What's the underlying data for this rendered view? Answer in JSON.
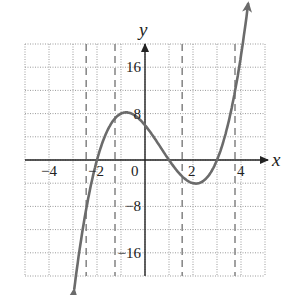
{
  "chart_data": {
    "type": "line",
    "title": "",
    "xlabel": "x",
    "ylabel": "y",
    "xlim": [
      -5,
      5
    ],
    "ylim": [
      -20,
      20
    ],
    "grid": true,
    "grid_step": {
      "x": 1,
      "y": 4
    },
    "x_ticks": [
      {
        "value": -4,
        "label": "−4"
      },
      {
        "value": -2,
        "label": "−2"
      },
      {
        "value": 0,
        "label": "0"
      },
      {
        "value": 2,
        "label": "2"
      },
      {
        "value": 4,
        "label": "4"
      }
    ],
    "y_ticks": [
      {
        "value": 16,
        "label": "16"
      },
      {
        "value": 8,
        "label": "8"
      },
      {
        "value": -8,
        "label": "−8"
      },
      {
        "value": -16,
        "label": "−16"
      }
    ],
    "series": [
      {
        "name": "f(x) = (x+2)(x-1)(x-3)",
        "color": "#6b6b6b",
        "x_range": [
          -2.95,
          4.3
        ],
        "points": [
          {
            "x": -2.95,
            "y": -20.0
          },
          {
            "x": -2,
            "y": 0
          },
          {
            "x": -1,
            "y": 8
          },
          {
            "x": 0,
            "y": 6
          },
          {
            "x": 1,
            "y": 0
          },
          {
            "x": 2,
            "y": -4
          },
          {
            "x": 3,
            "y": 0
          },
          {
            "x": 4,
            "y": 18
          }
        ],
        "arrows": "both-ends"
      }
    ],
    "vertical_dashed_lines": [
      -2.45,
      -1.25,
      1.55,
      3.75
    ],
    "colors": {
      "curve": "#6b6b6b",
      "axes": "#222222",
      "grid": "#9a9a9a",
      "dashed": "#8a8a8a"
    }
  }
}
